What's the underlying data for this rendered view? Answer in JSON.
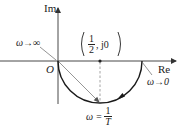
{
  "diagram": {
    "type": "nyquist-plot",
    "axes": {
      "real_label": "Re",
      "imag_label": "Im",
      "origin_label": "O"
    },
    "center_point": {
      "open_paren": "(",
      "numerator": "1",
      "denominator": "2",
      "suffix": ", j0",
      "close_paren": ")"
    },
    "annotations": {
      "omega_infinity": "ω→∞",
      "omega_zero": "ω→0",
      "omega_mid_prefix": "ω =",
      "omega_mid_numerator": "1",
      "omega_mid_denominator": "T"
    },
    "curve": {
      "shape": "lower semicircle",
      "from": "(0, j0)",
      "to": "(1, j0)",
      "center": "(1/2, j0)",
      "direction": "counterclockwise from ω→0 at right to ω→∞ at origin"
    },
    "colors": {
      "axis": "#333333",
      "curve": "#1a1a1a",
      "vector": "#8a8a8a",
      "dashed": "#9a9a9a"
    }
  }
}
